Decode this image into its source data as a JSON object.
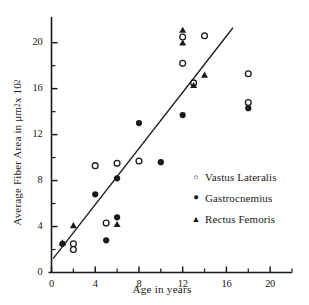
{
  "chart_data": {
    "type": "scatter",
    "title": "",
    "xlabel": "Age in years",
    "ylabel_parts": {
      "pre": "Average Fiber Area in μm",
      "sup1": "2",
      "mid": " x 10",
      "sup2": "2"
    },
    "ylabel": "Average Fiber Area in μm2 x 102",
    "xlim": [
      0,
      22
    ],
    "ylim": [
      0,
      21.8
    ],
    "xticks": [
      0,
      4,
      8,
      12,
      16,
      20
    ],
    "xtick_labels": [
      "0",
      "4",
      "8",
      "12",
      "16",
      "20"
    ],
    "xminor_ticks": [
      2,
      6,
      10,
      14,
      18,
      22
    ],
    "yticks": [
      0,
      4,
      8,
      12,
      16,
      20
    ],
    "ytick_labels": [
      "0",
      "4",
      "8",
      "12",
      "16",
      "20"
    ],
    "yminor_ticks": [
      2,
      6,
      10,
      14,
      18
    ],
    "grid": false,
    "legend_position": "right-lower",
    "marker_colors": {
      "open_circle": "#ffffff",
      "filled": "#1a1a1a",
      "axis": "#1a1a1a",
      "trendline": "#1a1a1a"
    },
    "trendline": {
      "label": "regression line",
      "x": [
        0.15,
        16.6
      ],
      "y": [
        1.2,
        21.3
      ]
    },
    "series": [
      {
        "name": "Vastus Lateralis",
        "marker": "open-circle",
        "points": [
          [
            2.0,
            2.5
          ],
          [
            2.0,
            2.0
          ],
          [
            4.0,
            9.3
          ],
          [
            5.0,
            4.3
          ],
          [
            6.0,
            9.5
          ],
          [
            8.0,
            9.7
          ],
          [
            12.0,
            20.5
          ],
          [
            12.0,
            18.2
          ],
          [
            13.0,
            16.5
          ],
          [
            14.0,
            20.6
          ],
          [
            18.0,
            17.3
          ],
          [
            18.0,
            14.8
          ]
        ]
      },
      {
        "name": "Gastrocnemius",
        "marker": "filled-circle",
        "points": [
          [
            1.0,
            2.5
          ],
          [
            4.0,
            6.8
          ],
          [
            5.0,
            2.8
          ],
          [
            6.0,
            8.2
          ],
          [
            6.0,
            4.8
          ],
          [
            8.0,
            13.0
          ],
          [
            10.0,
            9.6
          ],
          [
            12.0,
            13.7
          ],
          [
            18.0,
            14.3
          ]
        ]
      },
      {
        "name": "Rectus Femoris",
        "marker": "filled-triangle",
        "points": [
          [
            1.0,
            2.6
          ],
          [
            2.0,
            4.1
          ],
          [
            6.0,
            4.2
          ],
          [
            12.0,
            21.1
          ],
          [
            12.0,
            20.0
          ],
          [
            13.0,
            16.3
          ],
          [
            14.0,
            17.2
          ]
        ]
      }
    ],
    "legend": [
      {
        "glyph": "open-circle",
        "label": "Vastus Lateralis"
      },
      {
        "glyph": "filled-circle",
        "label": "Gastrocnemius"
      },
      {
        "glyph": "filled-triangle",
        "label": "Rectus Femoris"
      }
    ]
  }
}
